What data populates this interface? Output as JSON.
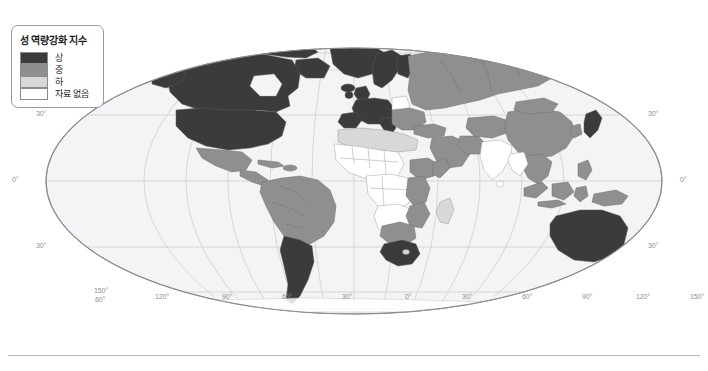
{
  "figure": {
    "kind": "world-choropleth-map",
    "projection": "mollweide-elliptical"
  },
  "legend": {
    "title": "성 역량강화 지수",
    "items": [
      {
        "label": "상",
        "color": "#3b3b3b",
        "key": "high"
      },
      {
        "label": "중",
        "color": "#8f8f8f",
        "key": "medium"
      },
      {
        "label": "하",
        "color": "#d8d8d8",
        "key": "low"
      },
      {
        "label": "자료 없음",
        "color": "#ffffff",
        "key": "no-data"
      }
    ]
  },
  "graticule": {
    "latitude_labels": [
      {
        "text": "30°",
        "side": "left",
        "x": 36,
        "y": 115
      },
      {
        "text": "0°",
        "side": "left",
        "x": 12,
        "y": 181
      },
      {
        "text": "30°",
        "side": "left",
        "x": 36,
        "y": 247
      },
      {
        "text": "60°",
        "side": "left",
        "x": 95,
        "y": 300
      },
      {
        "text": "30°",
        "side": "right",
        "x": 648,
        "y": 115
      },
      {
        "text": "0°",
        "side": "right",
        "x": 680,
        "y": 181
      },
      {
        "text": "30°",
        "side": "right",
        "x": 648,
        "y": 247
      }
    ],
    "longitude_labels": [
      {
        "text": "150°",
        "x": 94,
        "y": 291
      },
      {
        "text": "120°",
        "x": 155,
        "y": 297
      },
      {
        "text": "90°",
        "x": 222,
        "y": 297
      },
      {
        "text": "60°",
        "x": 282,
        "y": 297
      },
      {
        "text": "30°",
        "x": 342,
        "y": 297
      },
      {
        "text": "0°",
        "x": 405,
        "y": 297
      },
      {
        "text": "30°",
        "x": 462,
        "y": 297
      },
      {
        "text": "60°",
        "x": 522,
        "y": 297
      },
      {
        "text": "90°",
        "x": 582,
        "y": 297
      },
      {
        "text": "120°",
        "x": 638,
        "y": 297
      },
      {
        "text": "150°",
        "x": 698,
        "y": 297
      }
    ]
  },
  "map_colors": {
    "ocean": "#f4f4f6",
    "graticule_line": "#c9c9cf",
    "ellipse_border": "#8d8d93",
    "country_border": "#a0a0a6",
    "high": "#3b3b3b",
    "medium": "#8f8f8f",
    "low": "#d8d8d8",
    "no_data": "#ffffff"
  },
  "regions": [
    {
      "name": "Canada",
      "value": "high"
    },
    {
      "name": "United States",
      "value": "high"
    },
    {
      "name": "Greenland",
      "value": "high"
    },
    {
      "name": "Mexico",
      "value": "medium"
    },
    {
      "name": "Central America",
      "value": "medium"
    },
    {
      "name": "Caribbean",
      "value": "medium"
    },
    {
      "name": "Colombia",
      "value": "medium"
    },
    {
      "name": "Venezuela",
      "value": "medium"
    },
    {
      "name": "Brazil",
      "value": "medium"
    },
    {
      "name": "Peru",
      "value": "medium"
    },
    {
      "name": "Bolivia",
      "value": "medium"
    },
    {
      "name": "Argentina",
      "value": "high"
    },
    {
      "name": "Chile",
      "value": "high"
    },
    {
      "name": "Scandinavia",
      "value": "high"
    },
    {
      "name": "United Kingdom",
      "value": "high"
    },
    {
      "name": "Western Europe",
      "value": "high"
    },
    {
      "name": "Spain",
      "value": "high"
    },
    {
      "name": "Italy",
      "value": "high"
    },
    {
      "name": "Poland",
      "value": "no-data"
    },
    {
      "name": "Eastern Europe",
      "value": "medium"
    },
    {
      "name": "Russia",
      "value": "medium"
    },
    {
      "name": "Turkey",
      "value": "medium"
    },
    {
      "name": "North Africa",
      "value": "low"
    },
    {
      "name": "Sahel",
      "value": "no-data"
    },
    {
      "name": "West Africa",
      "value": "no-data"
    },
    {
      "name": "Central Africa",
      "value": "no-data"
    },
    {
      "name": "Ethiopia",
      "value": "medium"
    },
    {
      "name": "Kenya",
      "value": "medium"
    },
    {
      "name": "Tanzania",
      "value": "medium"
    },
    {
      "name": "Mozambique",
      "value": "medium"
    },
    {
      "name": "Botswana",
      "value": "medium"
    },
    {
      "name": "South Africa",
      "value": "high"
    },
    {
      "name": "Madagascar",
      "value": "low"
    },
    {
      "name": "Saudi Arabia",
      "value": "medium"
    },
    {
      "name": "Middle East",
      "value": "medium"
    },
    {
      "name": "India",
      "value": "no-data"
    },
    {
      "name": "China",
      "value": "medium"
    },
    {
      "name": "Mongolia",
      "value": "medium"
    },
    {
      "name": "Southeast Asia",
      "value": "medium"
    },
    {
      "name": "Indonesia",
      "value": "medium"
    },
    {
      "name": "Japan",
      "value": "high"
    },
    {
      "name": "Philippines",
      "value": "medium"
    },
    {
      "name": "Australia",
      "value": "high"
    },
    {
      "name": "New Zealand",
      "value": "high"
    }
  ]
}
